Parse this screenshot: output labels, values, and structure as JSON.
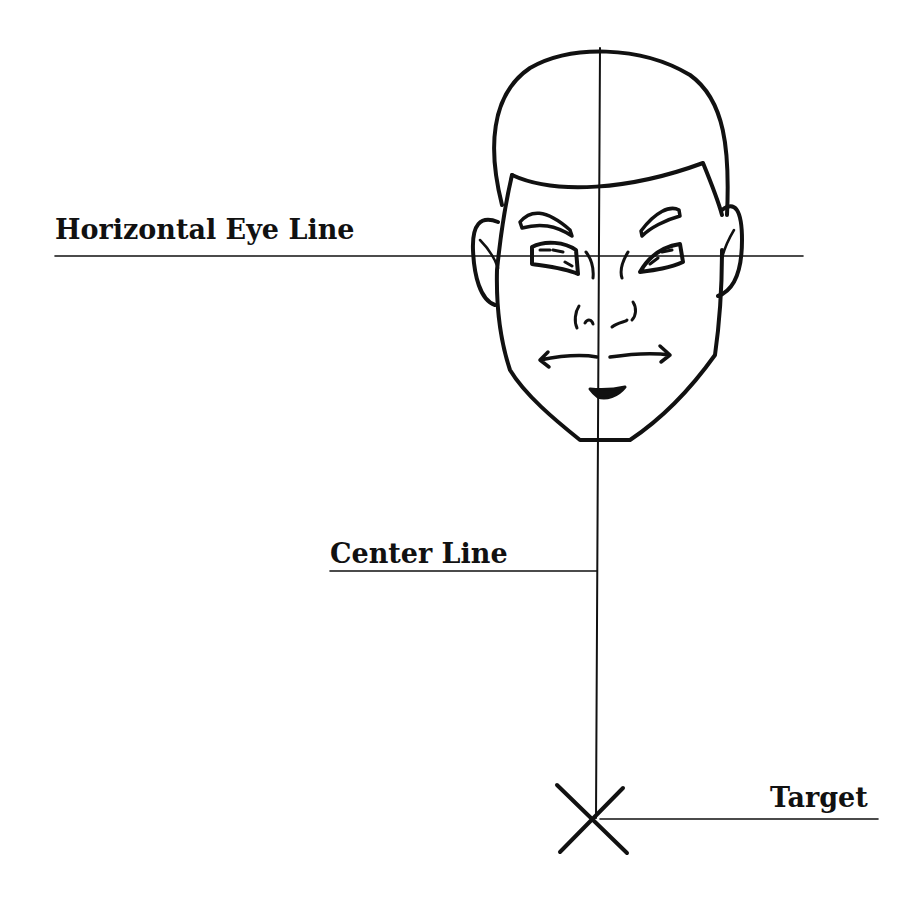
{
  "diagram": {
    "labels": {
      "eye_line": "Horizontal Eye Line",
      "center_line": "Center Line",
      "target": "Target"
    },
    "colors": {
      "ink": "#111111",
      "background": "#ffffff"
    },
    "elements": [
      "face-drawing",
      "horizontal-eye-line",
      "center-line",
      "target-x-mark"
    ]
  }
}
